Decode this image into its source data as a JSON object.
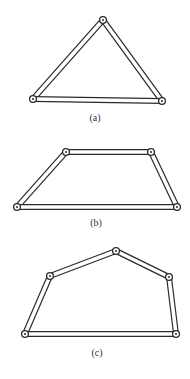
{
  "colors": {
    "stroke": "#2b2b2b",
    "fill": "#ffffff",
    "label": "#333333"
  },
  "figures": [
    {
      "id": "a",
      "label": "(a)",
      "label_pos": [
        95,
        112
      ],
      "shape": "triangle",
      "joints": [
        [
          33,
          99
        ],
        [
          103,
          20
        ],
        [
          162,
          101
        ]
      ]
    },
    {
      "id": "b",
      "label": "(b)",
      "label_pos": [
        96,
        217
      ],
      "shape": "trapezoid",
      "joints": [
        [
          17,
          207
        ],
        [
          66,
          152
        ],
        [
          151,
          152
        ],
        [
          177,
          207
        ]
      ]
    },
    {
      "id": "c",
      "label": "(c)",
      "label_pos": [
        97,
        347
      ],
      "shape": "pentagon",
      "joints": [
        [
          25,
          334
        ],
        [
          50,
          276
        ],
        [
          116,
          251
        ],
        [
          169,
          277
        ],
        [
          176,
          334
        ]
      ]
    }
  ],
  "bar_width": 6
}
